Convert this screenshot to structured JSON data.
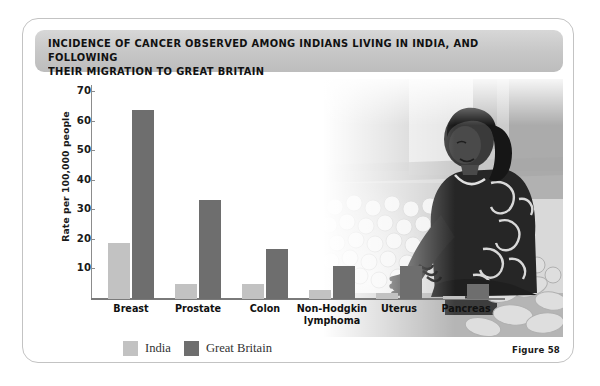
{
  "figure": {
    "title": "INCIDENCE OF CANCER OBSERVED AMONG INDIANS LIVING IN INDIA, AND FOLLOWING\nTHEIR MIGRATION TO GREAT BRITAIN",
    "caption": "Figure 58"
  },
  "photo": {
    "alt_name": "woman-at-market-stall-photo",
    "description": "Grayscale photograph of a woman in patterned sari seated at a vegetable market stall"
  },
  "colors": {
    "india": "#c2c2c2",
    "great_britain": "#6e6e6e",
    "banner": "#c6c6c6",
    "card_border": "#c3c3c3",
    "axis": "#8c8c8c"
  },
  "legend": {
    "position": "bottom-left",
    "entries": [
      {
        "label": "India",
        "color": "#c2c2c2"
      },
      {
        "label": "Great Britain",
        "color": "#6e6e6e"
      }
    ]
  },
  "chart_data": {
    "type": "bar",
    "title": "INCIDENCE OF CANCER OBSERVED AMONG INDIANS LIVING IN INDIA, AND FOLLOWING THEIR MIGRATION TO GREAT BRITAIN",
    "xlabel": "",
    "ylabel": "Rate per 100,000 people",
    "ylim": [
      0,
      72
    ],
    "yticks": [
      10,
      20,
      30,
      40,
      50,
      60,
      70
    ],
    "ytick_labels": [
      "10",
      "20",
      "30",
      "40",
      "50",
      "60",
      "70"
    ],
    "grid": false,
    "categories": [
      "Breast",
      "Prostate",
      "Colon",
      "Non-Hodgkin\nlymphoma",
      "Uterus",
      "Pancreas"
    ],
    "series": [
      {
        "name": "India",
        "color": "#c2c2c2",
        "values": [
          19,
          5,
          5,
          3,
          2,
          1
        ]
      },
      {
        "name": "Great Britain",
        "color": "#6e6e6e",
        "values": [
          64,
          33.5,
          17,
          11,
          11,
          5
        ]
      }
    ]
  }
}
